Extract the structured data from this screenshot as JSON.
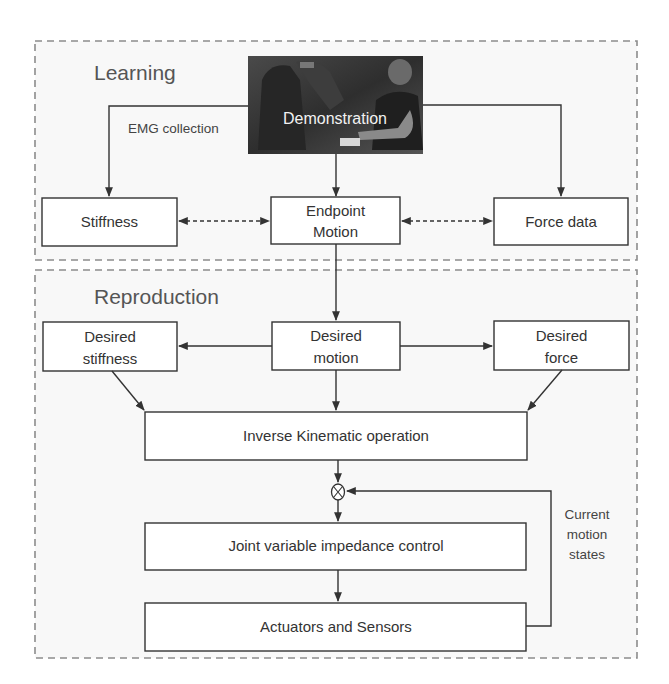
{
  "sections": {
    "learning": {
      "title": "Learning"
    },
    "reproduction": {
      "title": "Reproduction"
    }
  },
  "learning": {
    "photo_label": "Demonstration",
    "edge_label": "EMG collection",
    "boxes": {
      "stiffness": "Stiffness",
      "endpoint_motion": [
        "Endpoint",
        "Motion"
      ],
      "force_data": "Force data"
    }
  },
  "reproduction": {
    "boxes": {
      "desired_stiffness": [
        "Desired",
        "stiffness"
      ],
      "desired_motion": [
        "Desired",
        "motion"
      ],
      "desired_force": [
        "Desired",
        "force"
      ],
      "inverse_kinematic": "Inverse Kinematic operation",
      "joint_impedance": "Joint variable impedance control",
      "actuators_sensors": "Actuators and Sensors"
    },
    "feedback_label": [
      "Current",
      "motion",
      "states"
    ],
    "summing_junction": "⊗"
  },
  "colors": {
    "border_dashed": "#8c8c8c",
    "box_stroke": "#333333",
    "panel_fill": "#f8f8f8",
    "section_text": "#555555"
  }
}
